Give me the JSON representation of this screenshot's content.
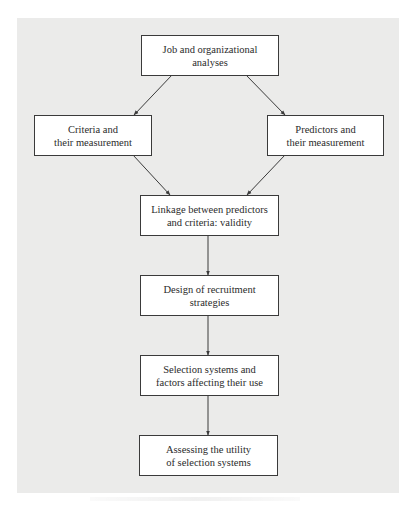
{
  "diagram": {
    "type": "flowchart",
    "background_color": "#ebebea",
    "box_color": "#ffffff",
    "line_color": "#3a3a3a",
    "nodes": [
      {
        "id": "job",
        "lines": [
          "Job and organizational",
          "analyses"
        ]
      },
      {
        "id": "criteria",
        "lines": [
          "Criteria and",
          "their measurement"
        ]
      },
      {
        "id": "predictors",
        "lines": [
          "Predictors and",
          "their measurement"
        ]
      },
      {
        "id": "linkage",
        "lines": [
          "Linkage between predictors",
          "and criteria: validity"
        ]
      },
      {
        "id": "recruitment",
        "lines": [
          "Design of recruitment",
          "strategies"
        ]
      },
      {
        "id": "selection",
        "lines": [
          "Selection systems and",
          "factors affecting their use"
        ]
      },
      {
        "id": "utility",
        "lines": [
          "Assessing the utility",
          "of selection systems"
        ]
      }
    ],
    "edges": [
      {
        "from": "job",
        "to": "criteria"
      },
      {
        "from": "job",
        "to": "predictors"
      },
      {
        "from": "criteria",
        "to": "linkage"
      },
      {
        "from": "predictors",
        "to": "linkage"
      },
      {
        "from": "linkage",
        "to": "recruitment"
      },
      {
        "from": "recruitment",
        "to": "selection"
      },
      {
        "from": "selection",
        "to": "utility"
      }
    ]
  }
}
